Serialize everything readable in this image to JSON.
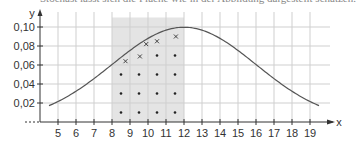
{
  "caption": "Stochast lässt sich die Fläche wie in der Abbildung dargestellt schätzen.",
  "chart_data": {
    "type": "line",
    "title": "",
    "xlabel": "x",
    "ylabel": "y",
    "xlim": [
      4,
      20
    ],
    "ylim": [
      0,
      0.11
    ],
    "grid": true,
    "x_ticks": [
      "5",
      "6",
      "7",
      "8",
      "9",
      "10",
      "11",
      "12",
      "13",
      "14",
      "15",
      "16",
      "17",
      "18",
      "19"
    ],
    "y_ticks": [
      "0,02",
      "0,04",
      "0,06",
      "0,08",
      "0,10"
    ],
    "series": [
      {
        "name": "normal density (mu=12, sigma=4)",
        "x": [
          4.5,
          5,
          6,
          7,
          8,
          9,
          10,
          11,
          12,
          13,
          14,
          15,
          16,
          17,
          18,
          19,
          19.5
        ],
        "values": [
          0.017,
          0.022,
          0.032,
          0.046,
          0.06,
          0.075,
          0.088,
          0.097,
          0.1,
          0.097,
          0.088,
          0.075,
          0.06,
          0.046,
          0.032,
          0.022,
          0.017
        ]
      }
    ],
    "shaded_region": {
      "x_from": 8,
      "x_to": 12
    },
    "dot_markers": [
      {
        "x": 8.5,
        "y": 0.01
      },
      {
        "x": 8.5,
        "y": 0.03
      },
      {
        "x": 8.5,
        "y": 0.05
      },
      {
        "x": 9.5,
        "y": 0.01
      },
      {
        "x": 9.5,
        "y": 0.03
      },
      {
        "x": 9.5,
        "y": 0.05
      },
      {
        "x": 10.5,
        "y": 0.01
      },
      {
        "x": 10.5,
        "y": 0.03
      },
      {
        "x": 10.5,
        "y": 0.05
      },
      {
        "x": 10.5,
        "y": 0.07
      },
      {
        "x": 11.5,
        "y": 0.01
      },
      {
        "x": 11.5,
        "y": 0.03
      },
      {
        "x": 11.5,
        "y": 0.05
      },
      {
        "x": 11.5,
        "y": 0.07
      }
    ],
    "cross_markers": [
      {
        "x": 8.75,
        "y": 0.064
      },
      {
        "x": 9.55,
        "y": 0.069
      },
      {
        "x": 9.9,
        "y": 0.082
      },
      {
        "x": 10.5,
        "y": 0.085
      },
      {
        "x": 11.55,
        "y": 0.09
      }
    ],
    "colors": {
      "curve": "#555555",
      "grid": "#cfcfcf",
      "shade": "#e4e4e4",
      "axis": "#333333"
    }
  }
}
